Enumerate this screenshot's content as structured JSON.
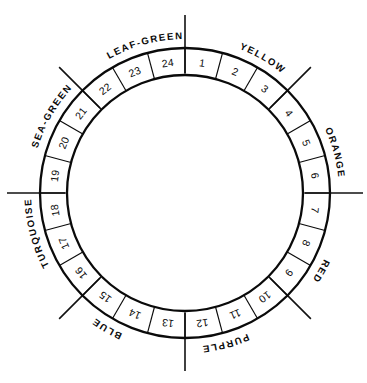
{
  "diagram": {
    "name": "color-wheel",
    "type": "annular-segmented-wheel",
    "segment_count": 24,
    "background_color": "#ffffff",
    "line_color": "#0a0a0a"
  },
  "geometry": {
    "center_x": 185,
    "center_y": 193,
    "outer_radius": 145,
    "inner_radius": 118,
    "segment_span_degrees": 15,
    "start_angle_degrees": -90,
    "tick_inner_radius": 120,
    "tick_outer_radius": 178,
    "label_radius": 154
  },
  "segments": [
    {
      "number": "1",
      "angle": -82.5
    },
    {
      "number": "2",
      "angle": -67.5
    },
    {
      "number": "3",
      "angle": -52.5
    },
    {
      "number": "4",
      "angle": -37.5
    },
    {
      "number": "5",
      "angle": -22.5
    },
    {
      "number": "6",
      "angle": -7.5
    },
    {
      "number": "7",
      "angle": 7.5
    },
    {
      "number": "8",
      "angle": 22.5
    },
    {
      "number": "9",
      "angle": 37.5
    },
    {
      "number": "10",
      "angle": 52.5
    },
    {
      "number": "11",
      "angle": 67.5
    },
    {
      "number": "12",
      "angle": 82.5
    },
    {
      "number": "13",
      "angle": 97.5
    },
    {
      "number": "14",
      "angle": 112.5
    },
    {
      "number": "15",
      "angle": 127.5
    },
    {
      "number": "16",
      "angle": 142.5
    },
    {
      "number": "17",
      "angle": 157.5
    },
    {
      "number": "18",
      "angle": 172.5
    },
    {
      "number": "19",
      "angle": 187.5
    },
    {
      "number": "20",
      "angle": 202.5
    },
    {
      "number": "21",
      "angle": 217.5
    },
    {
      "number": "22",
      "angle": 232.5
    },
    {
      "number": "23",
      "angle": 247.5
    },
    {
      "number": "24",
      "angle": 262.5
    }
  ],
  "color_families": [
    {
      "label": "YELLOW",
      "center_angle": -60,
      "segments": "1-3",
      "flip": false
    },
    {
      "label": "ORANGE",
      "center_angle": -15,
      "segments": "4-6",
      "flip": false
    },
    {
      "label": "RED",
      "center_angle": 30,
      "segments": "7-9",
      "flip": false
    },
    {
      "label": "PURPLE",
      "center_angle": 75,
      "segments": "10-12",
      "flip": false
    },
    {
      "label": "BLUE",
      "center_angle": 120,
      "segments": "13-15",
      "flip": false
    },
    {
      "label": "TURQUOISE",
      "center_angle": 165,
      "segments": "16-18",
      "flip": false
    },
    {
      "label": "SEA-GREEN",
      "center_angle": 210,
      "segments": "19-21",
      "flip": false
    },
    {
      "label": "LEAF-GREEN",
      "center_angle": 255,
      "segments": "22-24",
      "flip": false
    }
  ],
  "tick_marks": [
    {
      "name": "tick-top",
      "angle": -90
    },
    {
      "name": "tick-upper-right",
      "angle": -45
    },
    {
      "name": "tick-right",
      "angle": 0
    },
    {
      "name": "tick-lower-right",
      "angle": 45
    },
    {
      "name": "tick-bottom",
      "angle": 90
    },
    {
      "name": "tick-lower-left",
      "angle": 135
    },
    {
      "name": "tick-left",
      "angle": 180
    },
    {
      "name": "tick-upper-left",
      "angle": 225
    }
  ]
}
